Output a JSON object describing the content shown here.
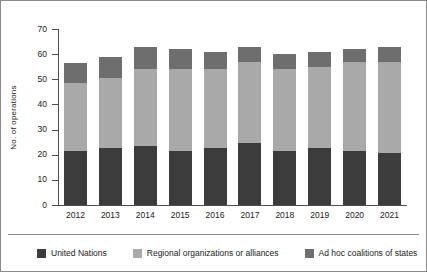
{
  "chart_data": {
    "type": "bar",
    "stacked": true,
    "title": "",
    "xlabel": "",
    "ylabel": "No. of operations",
    "ylim": [
      0,
      70
    ],
    "ytick_values": [
      0,
      10,
      20,
      30,
      40,
      50,
      60,
      70
    ],
    "ytick_labels": [
      "0",
      "10",
      "20",
      "30",
      "40",
      "50",
      "60",
      "70"
    ],
    "grid": false,
    "legend_position": "bottom",
    "categories": [
      "2012",
      "2013",
      "2014",
      "2015",
      "2016",
      "2017",
      "2018",
      "2019",
      "2020",
      "2021"
    ],
    "series": [
      {
        "name": "United Nations",
        "color": "#3c3c3c",
        "values": [
          21.5,
          22.5,
          23.5,
          21.5,
          22.5,
          24.5,
          21.5,
          22.5,
          21.5,
          20.5
        ]
      },
      {
        "name": "Regional organizations or alliances",
        "color": "#a9a9a9",
        "values": [
          27.0,
          28.0,
          30.5,
          32.5,
          31.5,
          32.5,
          32.5,
          32.5,
          35.5,
          36.5
        ]
      },
      {
        "name": "Ad hoc coalitions of states",
        "color": "#6e6e6e",
        "values": [
          8.0,
          8.5,
          9.0,
          8.0,
          7.0,
          6.0,
          6.0,
          6.0,
          5.0,
          6.0
        ]
      }
    ],
    "totals": [
      56.5,
      59.0,
      63.0,
      62.0,
      61.0,
      63.0,
      60.0,
      61.0,
      62.0,
      63.0
    ]
  },
  "legend": {
    "items": [
      {
        "label": "United Nations",
        "color": "#3c3c3c"
      },
      {
        "label": "Regional organizations or alliances",
        "color": "#a9a9a9"
      },
      {
        "label": "Ad hoc coalitions of states",
        "color": "#6e6e6e"
      }
    ]
  }
}
